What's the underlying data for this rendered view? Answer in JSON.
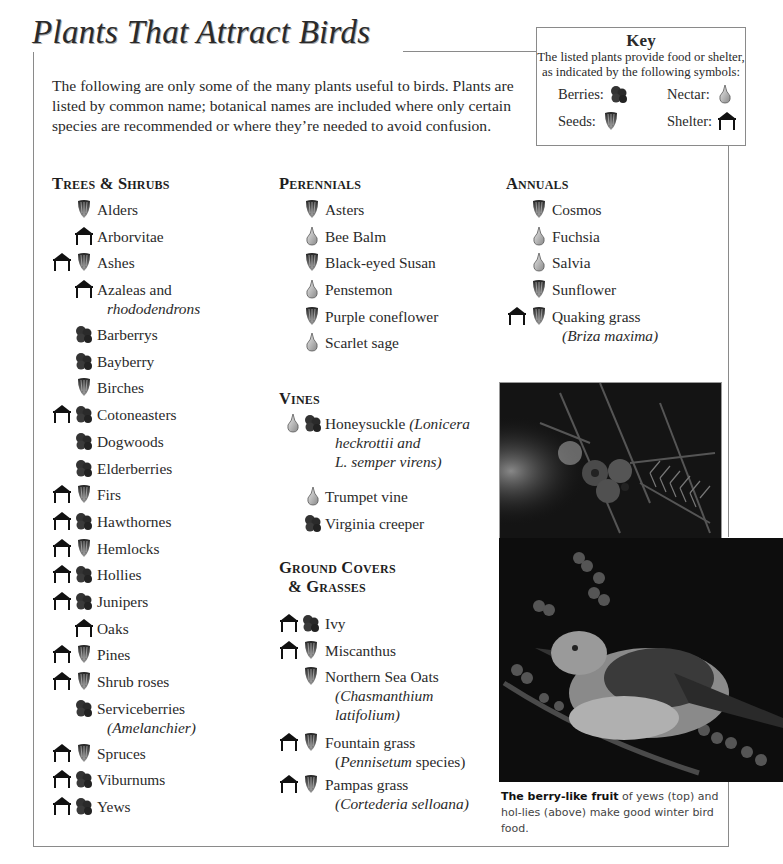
{
  "title": "Plants That Attract Birds",
  "intro": "The following are only some of the many plants useful to birds. Plants are listed by common name; botanical names are included where only certain species are recommended or where they’re needed to avoid confusion.",
  "key": {
    "title": "Key",
    "description": "The listed plants provide food or shelter, as indicated by the following symbols:",
    "items": [
      {
        "label": "Berries:",
        "icon": "berries-icon"
      },
      {
        "label": "Nectar:",
        "icon": "nectar-icon"
      },
      {
        "label": "Seeds:",
        "icon": "seeds-icon"
      },
      {
        "label": "Shelter:",
        "icon": "shelter-icon"
      }
    ]
  },
  "sections": {
    "trees": {
      "heading": "Trees & Shrubs",
      "items": [
        {
          "name": "Alders",
          "icons": [
            "seeds"
          ]
        },
        {
          "name": "Arborvitae",
          "icons": [
            "shelter"
          ]
        },
        {
          "name": "Ashes",
          "icons": [
            "shelter",
            "seeds"
          ]
        },
        {
          "name": "Azaleas and",
          "sub": "rhododendrons",
          "icons": [
            "shelter"
          ]
        },
        {
          "name": "Barberrys",
          "icons": [
            "berries"
          ]
        },
        {
          "name": "Bayberry",
          "icons": [
            "berries"
          ]
        },
        {
          "name": "Birches",
          "icons": [
            "seeds"
          ]
        },
        {
          "name": "Cotoneasters",
          "icons": [
            "shelter",
            "berries"
          ]
        },
        {
          "name": "Dogwoods",
          "icons": [
            "berries"
          ]
        },
        {
          "name": "Elderberries",
          "icons": [
            "berries"
          ]
        },
        {
          "name": "Firs",
          "icons": [
            "shelter",
            "seeds"
          ]
        },
        {
          "name": "Hawthornes",
          "icons": [
            "shelter",
            "berries"
          ]
        },
        {
          "name": "Hemlocks",
          "icons": [
            "shelter",
            "seeds"
          ]
        },
        {
          "name": "Hollies",
          "icons": [
            "shelter",
            "berries"
          ]
        },
        {
          "name": "Junipers",
          "icons": [
            "shelter",
            "berries"
          ]
        },
        {
          "name": "Oaks",
          "icons": [
            "shelter"
          ]
        },
        {
          "name": "Pines",
          "icons": [
            "shelter",
            "seeds"
          ]
        },
        {
          "name": "Shrub roses",
          "icons": [
            "shelter",
            "seeds"
          ]
        },
        {
          "name": "Serviceberries",
          "sub": "(Amelanchier)",
          "icons": [
            "berries"
          ]
        },
        {
          "name": "Spruces",
          "icons": [
            "shelter",
            "seeds"
          ]
        },
        {
          "name": "Viburnums",
          "icons": [
            "shelter",
            "berries"
          ]
        },
        {
          "name": "Yews",
          "icons": [
            "shelter",
            "berries"
          ]
        }
      ]
    },
    "perennials": {
      "heading": "Perennials",
      "items": [
        {
          "name": "Asters",
          "icons": [
            "seeds"
          ]
        },
        {
          "name": "Bee Balm",
          "icons": [
            "nectar"
          ]
        },
        {
          "name": "Black-eyed Susan",
          "icons": [
            "seeds"
          ]
        },
        {
          "name": "Penstemon",
          "icons": [
            "nectar"
          ]
        },
        {
          "name": "Purple coneflower",
          "icons": [
            "seeds"
          ]
        },
        {
          "name": "Scarlet sage",
          "icons": [
            "nectar"
          ]
        }
      ]
    },
    "vines": {
      "heading": "Vines",
      "items": [
        {
          "name": "Honeysuckle",
          "name_italic": " (Lonicera",
          "sub_line1_italic": "heckrottii",
          "sub_line1_rest": " and",
          "sub_line2": "L. semper virens)",
          "icons": [
            "nectar",
            "berries"
          ]
        },
        {
          "name": "Trumpet vine",
          "icons": [
            "nectar"
          ]
        },
        {
          "name": "Virginia creeper",
          "icons": [
            "berries"
          ]
        }
      ]
    },
    "ground": {
      "heading_line1": "Ground Covers",
      "heading_line2": "& Grasses",
      "items": [
        {
          "name": "Ivy",
          "icons": [
            "shelter",
            "berries"
          ]
        },
        {
          "name": "Miscanthus",
          "icons": [
            "shelter",
            "seeds"
          ]
        },
        {
          "name": "Northern Sea Oats",
          "sub": "(Chasmanthium",
          "sub2": "latifolium)",
          "icons": [
            "seeds"
          ]
        },
        {
          "name": "Fountain grass",
          "sub_open": "(",
          "sub_italic": "Pennisetum",
          "sub_rest": " species)",
          "icons": [
            "shelter",
            "seeds"
          ]
        },
        {
          "name": "Pampas grass",
          "sub": "(Cortederia selloana)",
          "icons": [
            "shelter",
            "seeds"
          ]
        }
      ]
    },
    "annuals": {
      "heading": "Annuals",
      "items": [
        {
          "name": "Cosmos",
          "icons": [
            "seeds"
          ]
        },
        {
          "name": "Fuchsia",
          "icons": [
            "nectar"
          ]
        },
        {
          "name": "Salvia",
          "icons": [
            "nectar"
          ]
        },
        {
          "name": "Sunflower",
          "icons": [
            "seeds"
          ]
        },
        {
          "name": "Quaking grass",
          "sub": "(Briza maxima)",
          "icons": [
            "shelter",
            "seeds"
          ]
        }
      ]
    }
  },
  "photos": {
    "top_alt": "Yew branch with berry-like fruit",
    "bottom_alt": "Mockingbird perched on holly branch with berries"
  },
  "caption": {
    "bold": "The berry-like fruit",
    "rest": " of yews (top) and hol-lies (above) make good winter bird food."
  },
  "colors": {
    "frame_line": "#8a8a8a",
    "text": "#2a2a2a"
  }
}
